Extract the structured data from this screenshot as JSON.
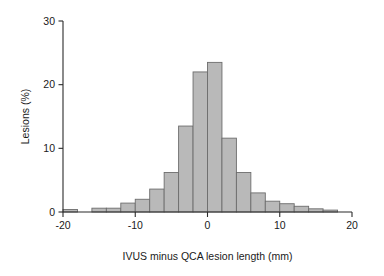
{
  "chart_data": {
    "type": "bar",
    "title": "",
    "subtitle": "",
    "xlabel": "IVUS minus QCA lesion length (mm)",
    "ylabel": "Lesions (%)",
    "xlim": [
      -20,
      20
    ],
    "ylim": [
      0,
      30
    ],
    "grid": false,
    "legend": null,
    "bin_width": 2,
    "bar_fill_color": "#b9b9b9",
    "bar_edge_color": "#6d6d6d",
    "axis_color": "#2b2b2b",
    "xticks": [
      -20,
      -10,
      0,
      10,
      20
    ],
    "xtick_labels": [
      "-20",
      "-10",
      "0",
      "10",
      "20"
    ],
    "yticks": [
      0,
      10,
      20,
      30
    ],
    "ytick_labels": [
      "0",
      "10",
      "20",
      "30"
    ],
    "categories": [
      -19,
      -17,
      -15,
      -13,
      -11,
      -9,
      -7,
      -5,
      -3,
      -1,
      1,
      3,
      5,
      7,
      9,
      11,
      13,
      15,
      17
    ],
    "bin_edges": [
      -20,
      -18,
      -16,
      -14,
      -12,
      -10,
      -8,
      -6,
      -4,
      -2,
      0,
      2,
      4,
      6,
      8,
      10,
      12,
      14,
      16,
      18
    ],
    "values": [
      0.4,
      0.0,
      0.6,
      0.6,
      1.4,
      2.0,
      3.6,
      6.2,
      13.5,
      22.0,
      23.5,
      11.6,
      6.2,
      3.0,
      1.7,
      1.3,
      0.9,
      0.5,
      0.3
    ],
    "series": [
      {
        "name": "Lesions (%)",
        "values": [
          0.4,
          0.0,
          0.6,
          0.6,
          1.4,
          2.0,
          3.6,
          6.2,
          13.5,
          22.0,
          23.5,
          11.6,
          6.2,
          3.0,
          1.7,
          1.3,
          0.9,
          0.5,
          0.3
        ]
      }
    ],
    "annotations": []
  },
  "axes": {
    "y_title": "Lesions (%)",
    "x_title": "IVUS minus QCA lesion length (mm)"
  }
}
